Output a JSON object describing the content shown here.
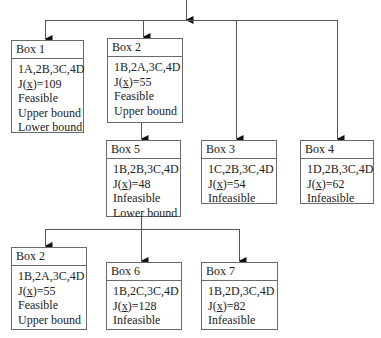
{
  "diagram": {
    "type": "branch-and-bound-tree",
    "nodes": [
      {
        "id": "box1",
        "title": "Box 1",
        "assignment": "1A,2B,3C,4D",
        "cost_prefix": "J(",
        "cost_var": "x",
        "cost_suffix": ")=109",
        "status": "Feasible",
        "bounds": [
          "Upper bound",
          "Lower bound"
        ]
      },
      {
        "id": "box2",
        "title": "Box 2",
        "assignment": "1B,2A,3C,4D",
        "cost_prefix": "J(",
        "cost_var": "x",
        "cost_suffix": ")=55",
        "status": "Feasible",
        "bounds": [
          "Upper bound"
        ]
      },
      {
        "id": "box3",
        "title": "Box 3",
        "assignment": "1C,2B,3C,4D",
        "cost_prefix": "J(",
        "cost_var": "x",
        "cost_suffix": ")=54",
        "status": "Infeasible",
        "bounds": []
      },
      {
        "id": "box4",
        "title": "Box 4",
        "assignment": "1D,2B,3C,4D",
        "cost_prefix": "J(",
        "cost_var": "x",
        "cost_suffix": ")=62",
        "status": "Infeasible",
        "bounds": []
      },
      {
        "id": "box5",
        "title": "Box 5",
        "assignment": "1B,2B,3C,4D",
        "cost_prefix": "J(",
        "cost_var": "x",
        "cost_suffix": ")=48",
        "status": "Infeasible",
        "bounds": [
          "Lower bound"
        ]
      },
      {
        "id": "box2b",
        "title": "Box 2",
        "assignment": "1B,2A,3C,4D",
        "cost_prefix": "J(",
        "cost_var": "x",
        "cost_suffix": ")=55",
        "status": "Feasible",
        "bounds": [
          "Upper bound"
        ]
      },
      {
        "id": "box6",
        "title": "Box 6",
        "assignment": "1B,2C,3C,4D",
        "cost_prefix": "J(",
        "cost_var": "x",
        "cost_suffix": ")=128",
        "status": "Infeasible",
        "bounds": []
      },
      {
        "id": "box7",
        "title": "Box 7",
        "assignment": "1B,2D,3C,4D",
        "cost_prefix": "J(",
        "cost_var": "x",
        "cost_suffix": ")=82",
        "status": "Infeasible",
        "bounds": []
      }
    ],
    "edges": [
      [
        "root",
        "box1"
      ],
      [
        "root",
        "box2"
      ],
      [
        "root",
        "box3"
      ],
      [
        "root",
        "box4"
      ],
      [
        "box2",
        "box5"
      ],
      [
        "box5",
        "box2b"
      ],
      [
        "box5",
        "box6"
      ],
      [
        "box5",
        "box7"
      ]
    ],
    "colors": {
      "line": "#555555",
      "border": "#6a6a6a",
      "text": "#222222"
    }
  }
}
